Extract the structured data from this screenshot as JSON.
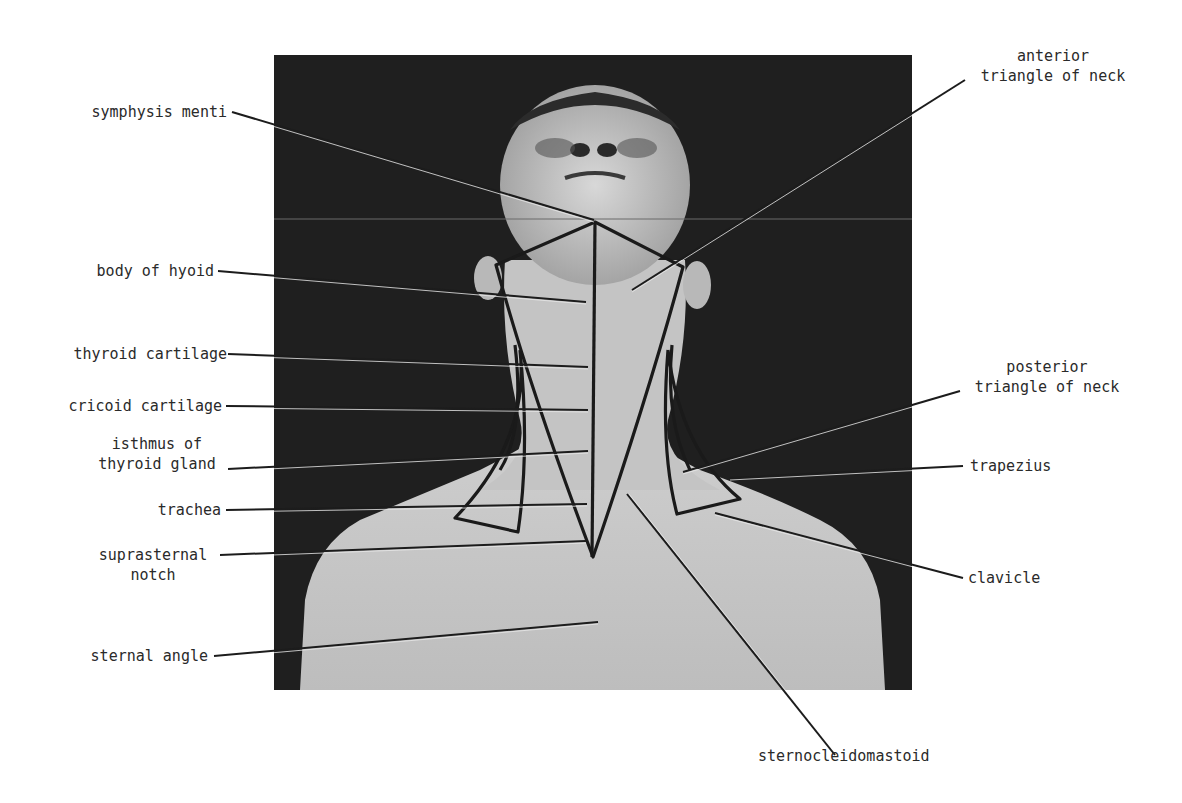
{
  "figure": {
    "type": "anatomical labeled photograph",
    "colors": {
      "background": "#ffffff",
      "photo_background": "#1f1f1f",
      "skin": "#c9c9c9",
      "outline": "#1a1a1a",
      "leader_line": "#1c1c1c",
      "label_text": "#2a2a2a"
    }
  },
  "labels": {
    "left": [
      {
        "id": "symphysis_menti",
        "text": "symphysis menti"
      },
      {
        "id": "body_of_hyoid",
        "text": "body of hyoid"
      },
      {
        "id": "thyroid_cartilage",
        "text": "thyroid cartilage"
      },
      {
        "id": "cricoid_cartilage",
        "text": "cricoid cartilage"
      },
      {
        "id": "isthmus_line1",
        "text": "isthmus of"
      },
      {
        "id": "isthmus_line2",
        "text": "thyroid gland"
      },
      {
        "id": "trachea",
        "text": "trachea"
      },
      {
        "id": "suprasternal_line1",
        "text": "suprasternal"
      },
      {
        "id": "suprasternal_line2",
        "text": "notch"
      },
      {
        "id": "sternal_angle",
        "text": "sternal angle"
      }
    ],
    "right": [
      {
        "id": "anterior_line1",
        "text": "anterior"
      },
      {
        "id": "anterior_line2",
        "text": "triangle of neck"
      },
      {
        "id": "posterior_line1",
        "text": "posterior"
      },
      {
        "id": "posterior_line2",
        "text": "triangle of neck"
      },
      {
        "id": "trapezius",
        "text": "trapezius"
      },
      {
        "id": "clavicle",
        "text": "clavicle"
      }
    ],
    "bottom": [
      {
        "id": "sternocleidomastoid",
        "text": "sternocleidomastoid"
      }
    ]
  }
}
